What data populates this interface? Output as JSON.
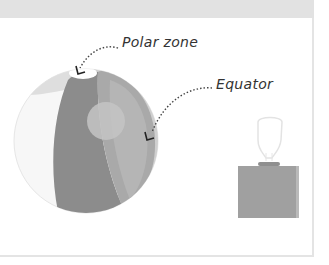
{
  "diagram": {
    "labels": {
      "polar_zone": "Polar zone",
      "equator": "Equator"
    },
    "objects": {
      "globe": "sphere-ball",
      "light_source": "lamp"
    },
    "colors": {
      "band_top": "#e2e2e2",
      "frame_border": "#e4e4e4",
      "globe_dark": "#8c8c8c",
      "globe_mid": "#a9a9a9",
      "globe_light": "#cfcfcf",
      "globe_highlight": "#bdbdbd",
      "lamp_base": "#9a9a9a",
      "arrow": "#444444"
    }
  }
}
